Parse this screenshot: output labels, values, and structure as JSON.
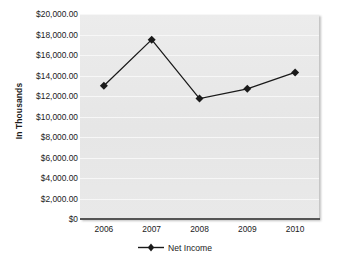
{
  "chart_data": {
    "type": "line",
    "title": "",
    "xlabel": "",
    "ylabel": "In Thousands",
    "categories": [
      "2006",
      "2007",
      "2008",
      "2009",
      "2010"
    ],
    "series": [
      {
        "name": "Net Income",
        "values": [
          13000,
          17500,
          11750,
          12700,
          14300
        ],
        "color": "#1a1a1a",
        "marker": "diamond"
      }
    ],
    "ylim": [
      0,
      20000
    ],
    "ytick_values": [
      20000,
      18000,
      16000,
      14000,
      12000,
      10000,
      8000,
      6000,
      4000,
      2000,
      0
    ],
    "ytick_labels": [
      "$20,000.00",
      "$18,000.00",
      "$16,000.00",
      "$14,000.00",
      "$12,000.00",
      "$10,000.00",
      "$8,000.00",
      "$6,000.00",
      "$4,000.00",
      "$2,000.00",
      "$0"
    ],
    "xtick_labels": [
      "2006",
      "2007",
      "2008",
      "2009",
      "2010"
    ],
    "grid": true,
    "grid_color": "#f7f7f7",
    "plot_background": "#e9e9e9",
    "legend": {
      "position": "bottom-center",
      "entries": [
        "Net Income"
      ]
    }
  }
}
